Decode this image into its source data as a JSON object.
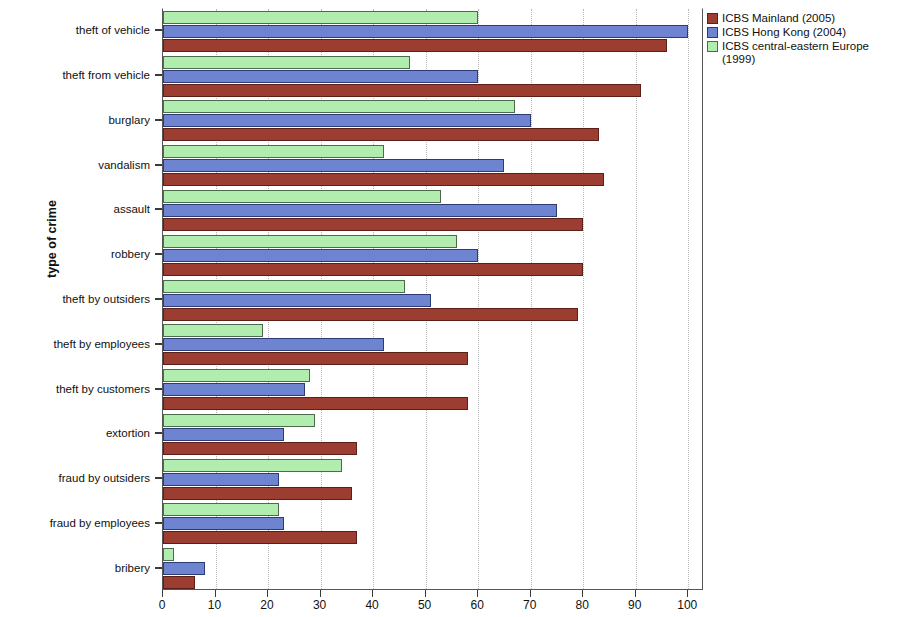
{
  "chart_data": {
    "type": "bar",
    "orientation": "horizontal",
    "title": "",
    "xlabel": "",
    "ylabel": "type of crime",
    "xlim": [
      0,
      103
    ],
    "ylim": null,
    "grid": true,
    "grid_axis": "x",
    "legend_position": "right",
    "xticks": [
      0,
      10,
      20,
      30,
      40,
      50,
      60,
      70,
      80,
      90,
      100
    ],
    "xticklabels": [
      "0",
      "10",
      "20",
      "30",
      "40",
      "50",
      "60",
      "70",
      "80",
      "90",
      "100"
    ],
    "categories": [
      "theft of vehicle",
      "theft from vehicle",
      "burglary",
      "vandalism",
      "assault",
      "robbery",
      "theft by outsiders",
      "theft by employees",
      "theft by customers",
      "extortion",
      "fraud by outsiders",
      "fraud by employees",
      "bribery"
    ],
    "series": [
      {
        "name": "ICBS Mainland (2005)",
        "color": "#9c3d32",
        "values": [
          96,
          91,
          83,
          84,
          80,
          80,
          79,
          58,
          58,
          37,
          36,
          37,
          6
        ]
      },
      {
        "name": "ICBS Hong Kong (2004)",
        "color": "#6f84d0",
        "values": [
          100,
          60,
          70,
          65,
          75,
          60,
          51,
          42,
          27,
          23,
          22,
          23,
          8
        ]
      },
      {
        "name": "ICBS central-eastern Europe (1999)",
        "color": "#b2edb0",
        "values": [
          60,
          47,
          67,
          42,
          53,
          56,
          46,
          19,
          28,
          29,
          34,
          22,
          2
        ]
      }
    ]
  },
  "legend": {
    "entries": [
      {
        "label": "ICBS Mainland (2005)",
        "swatch": "red"
      },
      {
        "label": "ICBS Hong Kong (2004)",
        "swatch": "blue"
      },
      {
        "label": "ICBS central-eastern Europe (1999)",
        "swatch": "green"
      }
    ]
  },
  "axes": {
    "y_title": "type of crime"
  }
}
